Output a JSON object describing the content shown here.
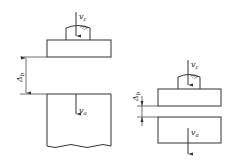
{
  "diagram": {
    "left_figure": {
      "tool_velocity_label": "v",
      "tool_velocity_sub": "c",
      "gap_label": "Δ",
      "gap_sub": "b",
      "workpiece_velocity_label": "v",
      "workpiece_velocity_sub": "a"
    },
    "right_figure": {
      "tool_velocity_label": "v",
      "tool_velocity_sub": "c",
      "gap_label": "Δ",
      "gap_sub": "b",
      "workpiece_velocity_label": "v",
      "workpiece_velocity_sub": "a"
    },
    "colors": {
      "line": "#333333",
      "background": "#ffffff"
    }
  }
}
